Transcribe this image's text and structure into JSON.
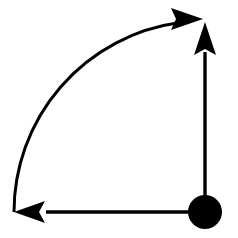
{
  "figure": {
    "background_color": "#ffffff",
    "ink_color": "#000000",
    "canvas": {
      "width": 238,
      "height": 238
    }
  },
  "geometry": {
    "pivot": {
      "name": "pivot-disk",
      "center_x": 205,
      "center_y": 212,
      "radius": 17,
      "fill": "#000000"
    },
    "vertical_arrow": {
      "name": "vertical-arrow",
      "direction": "up",
      "x": 205,
      "shaft_from_y": 212,
      "shaft_to_y": 52,
      "tip_x": 205,
      "tip_y": 22,
      "head_length": 33,
      "head_half_width": 11,
      "stroke_width": 3.4
    },
    "horizontal_arrow": {
      "name": "horizontal-arrow",
      "direction": "left",
      "y": 212,
      "shaft_from_x": 205,
      "shaft_to_x": 46,
      "tip_x": 14,
      "tip_y": 212,
      "head_length": 31,
      "head_half_width": 11,
      "stroke_width": 3.4
    },
    "curved_arrow": {
      "name": "rotation-arc-arrow",
      "direction": "counterclockwise",
      "center_x": 205,
      "center_y": 212,
      "radius": 191,
      "start_x": 15,
      "start_y": 210,
      "start_angle_deg": 180,
      "end_angle_deg": 98,
      "sweep_deg": 82,
      "tip_x": 203,
      "tip_y": 19,
      "head_base_x": 171,
      "head_length": 32,
      "head_half_width": 11,
      "stroke_width": 3.0
    }
  },
  "elements": {
    "pivot_label": "pivot point",
    "vertical_arrow_label": "upward arrow",
    "horizontal_arrow_label": "leftward arrow",
    "curved_arrow_label": "rotation arc arrow"
  }
}
